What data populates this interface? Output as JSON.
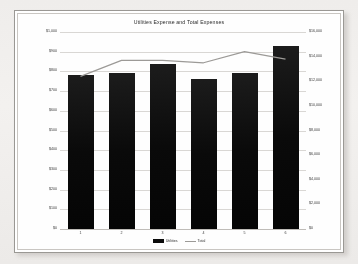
{
  "document": {
    "kind": "spreadsheet-chart-printout"
  },
  "chart_data": {
    "type": "bar",
    "title": "Utilities Expense and Total Expenses",
    "xlabel": "",
    "ylabel": "",
    "categories": [
      "1",
      "2",
      "3",
      "4",
      "5",
      "6"
    ],
    "series": [
      {
        "name": "Utilities",
        "type": "bar",
        "axis": "left",
        "color": "#0b0b0b",
        "values": [
          780,
          790,
          840,
          760,
          790,
          930
        ]
      },
      {
        "name": "Total",
        "type": "line",
        "axis": "right",
        "color": "#9c9a97",
        "values": [
          12400,
          13700,
          13700,
          13500,
          14400,
          13800
        ]
      }
    ],
    "left_axis": {
      "min": 0,
      "max": 1000,
      "step": 100,
      "ticks": [
        "$1,000",
        "$900",
        "$800",
        "$700",
        "$600",
        "$500",
        "$400",
        "$300",
        "$200",
        "$100",
        "$0"
      ]
    },
    "right_axis": {
      "min": 0,
      "max": 16000,
      "step": 2000,
      "ticks": [
        "$16,000",
        "$14,000",
        "$12,000",
        "$10,000",
        "$8,000",
        "$6,000",
        "$4,000",
        "$2,000",
        "$0"
      ]
    },
    "legend": {
      "position": "bottom",
      "entries": [
        "Utilities",
        "Total"
      ]
    },
    "grid": true
  }
}
